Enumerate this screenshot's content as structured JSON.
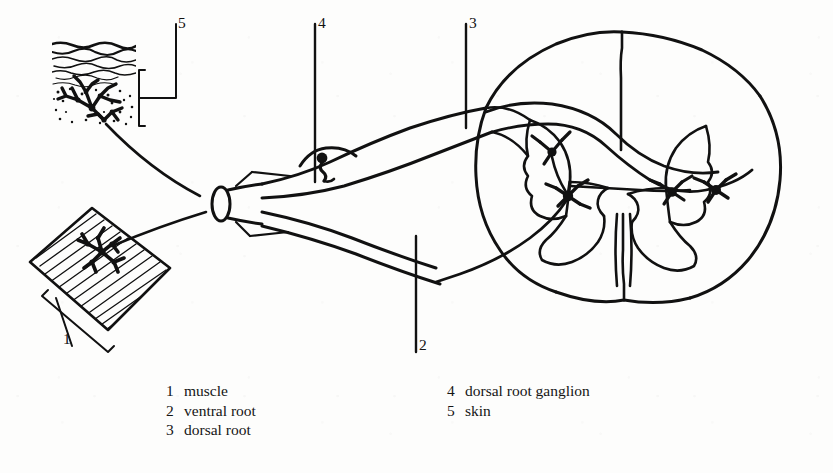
{
  "figure": {
    "type": "anatomical-line-drawing",
    "style": "black ink line art on off-white paper",
    "ink_color": "#111111",
    "paper_color": "#fdfdfc"
  },
  "callouts": [
    {
      "id": "1",
      "number": "1",
      "target": "muscle"
    },
    {
      "id": "2",
      "number": "2",
      "target": "ventral root"
    },
    {
      "id": "3",
      "number": "3",
      "target": "dorsal root"
    },
    {
      "id": "4",
      "number": "4",
      "target": "dorsal root ganglion"
    },
    {
      "id": "5",
      "number": "5",
      "target": "skin"
    }
  ],
  "legend": {
    "left_column": [
      {
        "number": "1",
        "label": "muscle"
      },
      {
        "number": "2",
        "label": "ventral root"
      },
      {
        "number": "3",
        "label": "dorsal root"
      }
    ],
    "right_column": [
      {
        "number": "4",
        "label": "dorsal root ganglion"
      },
      {
        "number": "5",
        "label": "skin"
      }
    ]
  },
  "structures": {
    "skin_inset": "skin block with stratified surface layers, stippled dermis and a branching free nerve ending",
    "muscle_inset": "tilted striated muscle band with motor end plate arborisation",
    "nerve_trunk": "cut spinal nerve with elliptical cut end and diverging fibre bundles",
    "ganglion": "dorsal root ganglion swelling containing a pseudounipolar sensory cell body",
    "cord": "spinal cord cross-section with butterfly-shaped grey matter, dorsal median sulcus and ventral median fissure",
    "neurons": "interneuron and motor neuron cell bodies with dendritic arborisations in the grey matter"
  }
}
